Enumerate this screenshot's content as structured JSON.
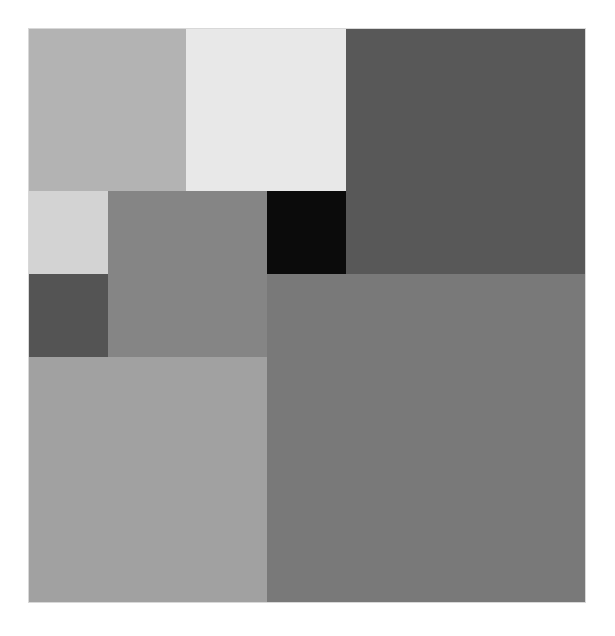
{
  "composition": {
    "description": "Grayscale composition of nested rectangular tiles",
    "background": "#ffffff",
    "frame": {
      "x": 29,
      "y": 29,
      "width": 556,
      "height": 573
    },
    "tiles": [
      {
        "name": "tile-top-left",
        "x": 29,
        "y": 29,
        "w": 157,
        "h": 162,
        "color": "#b3b3b3"
      },
      {
        "name": "tile-top-middle",
        "x": 186,
        "y": 29,
        "w": 160,
        "h": 162,
        "color": "#e8e8e8"
      },
      {
        "name": "tile-top-right",
        "x": 346,
        "y": 29,
        "w": 239,
        "h": 245,
        "color": "#585858"
      },
      {
        "name": "tile-small-light",
        "x": 29,
        "y": 191,
        "w": 79,
        "h": 83,
        "color": "#d3d3d3"
      },
      {
        "name": "tile-small-dark",
        "x": 29,
        "y": 274,
        "w": 79,
        "h": 83,
        "color": "#545454"
      },
      {
        "name": "tile-middle-gray",
        "x": 108,
        "y": 191,
        "w": 159,
        "h": 166,
        "color": "#858585"
      },
      {
        "name": "tile-black",
        "x": 267,
        "y": 191,
        "w": 79,
        "h": 83,
        "color": "#0b0b0b"
      },
      {
        "name": "tile-bottom-left",
        "x": 29,
        "y": 357,
        "w": 238,
        "h": 245,
        "color": "#a1a1a1"
      },
      {
        "name": "tile-bottom-right",
        "x": 267,
        "y": 274,
        "w": 318,
        "h": 328,
        "color": "#797979"
      }
    ]
  }
}
